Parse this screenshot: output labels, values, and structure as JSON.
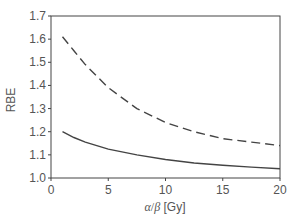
{
  "chart_data": {
    "type": "line",
    "title": "",
    "xlabel": "α/β [Gy]",
    "ylabel": "RBE",
    "xlim": [
      0,
      20
    ],
    "ylim": [
      1.0,
      1.7
    ],
    "xticks": [
      "0",
      "5",
      "10",
      "15",
      "20"
    ],
    "yticks": [
      "1.0",
      "1.1",
      "1.2",
      "1.3",
      "1.4",
      "1.5",
      "1.6",
      "1.7"
    ],
    "grid": false,
    "legend": null,
    "series": [
      {
        "name": "dashed",
        "style": "dashed",
        "x": [
          1,
          2,
          3,
          4,
          5,
          7.5,
          10,
          12.5,
          15,
          17.5,
          20
        ],
        "values": [
          1.61,
          1.55,
          1.49,
          1.44,
          1.39,
          1.3,
          1.24,
          1.2,
          1.17,
          1.155,
          1.14
        ]
      },
      {
        "name": "solid",
        "style": "solid",
        "x": [
          1,
          2,
          3,
          4,
          5,
          7.5,
          10,
          12.5,
          15,
          17.5,
          20
        ],
        "values": [
          1.2,
          1.175,
          1.155,
          1.14,
          1.125,
          1.1,
          1.08,
          1.065,
          1.055,
          1.047,
          1.04
        ]
      }
    ]
  },
  "axes": {
    "xlabel_alpha": "α",
    "xlabel_slash": "/",
    "xlabel_beta": "β",
    "xlabel_unit": " [Gy]",
    "ylabel": "RBE"
  }
}
